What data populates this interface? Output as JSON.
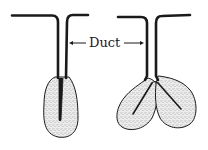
{
  "diagram": {
    "type": "gland-structure",
    "label": "Duct",
    "colors": {
      "ink": "#1a1a1a",
      "gland_fill": "#e6e6e6",
      "stipple": "#6b6b6b",
      "background": "#ffffff"
    },
    "figures": [
      {
        "id": "simple-gland",
        "lobes": 1
      },
      {
        "id": "branched-gland",
        "lobes": 2
      }
    ]
  }
}
